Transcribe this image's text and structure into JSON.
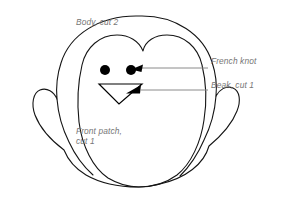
{
  "diagram": {
    "type": "sewing-pattern-diagram",
    "background_color": "#ffffff",
    "outline_color": "#141414",
    "label_color": "#767676",
    "leader_color": "#8a8a8a",
    "marker_color": "#000000"
  },
  "labels": {
    "body": "Body, cut 2",
    "front_patch_line1": "Front patch,",
    "front_patch_line2": "cut 1",
    "french_knot": "French knot",
    "beak": "Beak, cut 1"
  },
  "parts": [
    {
      "name": "body",
      "label": "Body, cut 2",
      "cut_count": 2
    },
    {
      "name": "front-patch",
      "label": "Front patch, cut 1",
      "cut_count": 1
    },
    {
      "name": "beak",
      "label": "Beak, cut 1",
      "cut_count": 1
    },
    {
      "name": "french-knot",
      "label": "French knot",
      "cut_count": null
    }
  ],
  "annotations": [
    {
      "target": "right-eye",
      "label": "French knot",
      "leader": "horizontal-line-with-arrow"
    },
    {
      "target": "beak-triangle",
      "label": "Beak, cut 1",
      "leader": "horizontal-line-with-arrow"
    }
  ]
}
